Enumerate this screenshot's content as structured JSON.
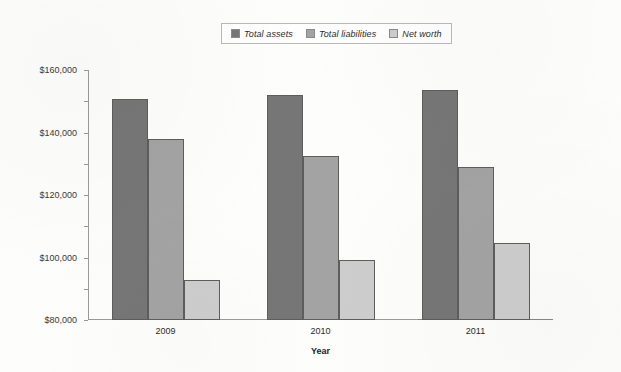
{
  "chart_data": {
    "type": "bar",
    "title": "",
    "xlabel": "Year",
    "ylabel": "",
    "categories": [
      "2009",
      "2010",
      "2011"
    ],
    "series": [
      {
        "name": "Total assets",
        "color": "#767676",
        "values": [
          141500,
          144000,
          147500
        ]
      },
      {
        "name": "Total liabilities",
        "color": "#a3a3a3",
        "values": [
          116000,
          105000,
          98000
        ]
      },
      {
        "name": "Net worth",
        "color": "#cdcdcd",
        "values": [
          25500,
          38500,
          49000
        ]
      }
    ],
    "ylim": [
      0,
      160000
    ],
    "ytick_step": 20000,
    "ytick_labels": [
      "$160,000",
      "$140,000",
      "$120,000",
      "$100,000",
      "$80,000",
      "$60,000",
      "$40,000",
      "$20,000",
      "$0"
    ],
    "ytick_values": [
      160000,
      140000,
      120000,
      100000,
      80000,
      60000,
      40000,
      20000,
      0
    ],
    "grid": false,
    "legend_position": "top-center"
  }
}
